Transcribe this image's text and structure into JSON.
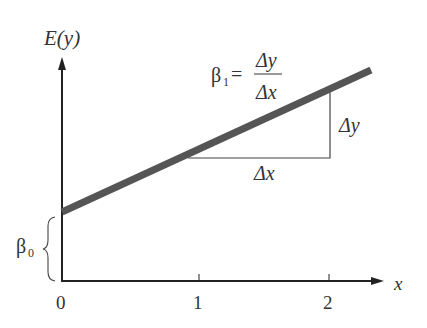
{
  "diagram": {
    "y_axis_label": "E(y)",
    "x_axis_label": "x",
    "x_ticks": [
      "0",
      "1",
      "2"
    ],
    "slope_label_lhs": "β",
    "slope_label_sub": "1",
    "slope_equals": "=",
    "slope_numerator": "Δy",
    "slope_denominator": "Δx",
    "delta_y_label": "Δy",
    "delta_x_label": "Δx",
    "intercept_label": "β",
    "intercept_sub": "0",
    "colors": {
      "line": "#555555",
      "axis": "#222222",
      "text": "#333333"
    }
  }
}
